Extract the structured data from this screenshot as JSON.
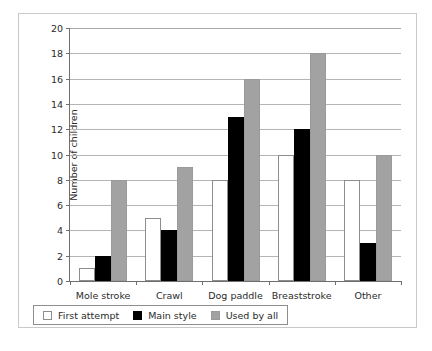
{
  "chart_data": {
    "type": "bar",
    "title": "",
    "xlabel": "",
    "ylabel": "Number of children",
    "ylim": [
      0,
      20
    ],
    "ytick_step": 2,
    "yticks": [
      0,
      2,
      4,
      6,
      8,
      10,
      12,
      14,
      16,
      18,
      20
    ],
    "grid": true,
    "grid_axis": "y",
    "legend_position": "below-plot-left",
    "categories": [
      "Mole stroke",
      "Crawl",
      "Dog paddle",
      "Breaststroke",
      "Other"
    ],
    "series": [
      {
        "name": "First attempt",
        "color": "#ffffff",
        "values": [
          1,
          5,
          8,
          10,
          8
        ]
      },
      {
        "name": "Main style",
        "color": "#000000",
        "values": [
          2,
          4,
          13,
          12,
          3
        ]
      },
      {
        "name": "Used by all",
        "color": "#a2a2a2",
        "values": [
          8,
          9,
          16,
          18,
          10
        ]
      }
    ]
  },
  "colors": {
    "first_attempt": "#ffffff",
    "main_style": "#000000",
    "used_by_all": "#a2a2a2",
    "gridline": "#b4b4b4",
    "axis": "#6f6f6f",
    "frame": "#c9c9c9",
    "text": "#2b2b2b"
  }
}
